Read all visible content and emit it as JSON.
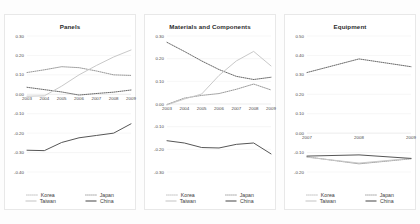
{
  "figure": {
    "background_color": "#fdfdfd",
    "panel_background": "#ffffff",
    "panel_border_color": "#e8e8e8"
  },
  "series_style": {
    "korea": {
      "color": "#8c8c8c",
      "dash": "0.9 1.1",
      "width": 0.9
    },
    "japan": {
      "color": "#595959",
      "dash": "0.9 1.1",
      "width": 0.9
    },
    "taiwan": {
      "color": "#c9c9c9",
      "dash": "none",
      "width": 1.0
    },
    "china": {
      "color": "#565656",
      "dash": "none",
      "width": 1.0
    }
  },
  "legend": {
    "items": [
      {
        "key": "korea",
        "label": "Korea"
      },
      {
        "key": "japan",
        "label": "Japan"
      },
      {
        "key": "taiwan",
        "label": "Taiwan"
      },
      {
        "key": "china",
        "label": "China"
      }
    ]
  },
  "chart_data": [
    {
      "type": "line",
      "title": "Panels",
      "xlabel": "",
      "ylabel": "",
      "x": [
        "2003",
        "2004",
        "2005",
        "2006",
        "2007",
        "2008",
        "2009"
      ],
      "yticks": [
        "0.30",
        "0.20",
        "0.10",
        "0.00",
        "-0.10",
        "-0.20",
        "-0.30",
        "-0.40"
      ],
      "ylim": [
        -0.4,
        0.3
      ],
      "grid": true,
      "legend_position": "bottom",
      "series": [
        {
          "name": "Korea",
          "values": [
            0.112,
            0.126,
            0.142,
            0.137,
            0.12,
            0.1,
            0.097
          ]
        },
        {
          "name": "Japan",
          "values": [
            0.036,
            0.024,
            0.012,
            -0.004,
            0.004,
            0.011,
            0.022
          ]
        },
        {
          "name": "Taiwan",
          "values": [
            -0.01,
            -0.008,
            0.042,
            0.1,
            0.148,
            0.192,
            0.228
          ]
        },
        {
          "name": "China",
          "values": [
            -0.288,
            -0.29,
            -0.248,
            -0.224,
            -0.212,
            -0.2,
            -0.152
          ]
        }
      ]
    },
    {
      "type": "line",
      "title": "Materials and Components",
      "xlabel": "",
      "ylabel": "",
      "x": [
        "2003",
        "2004",
        "2005",
        "2006",
        "2007",
        "2008",
        "2009"
      ],
      "yticks": [
        "0.30",
        "0.20",
        "0.10",
        "0.00",
        "-0.10",
        "-0.20",
        "-0.30"
      ],
      "ylim": [
        -0.3,
        0.3
      ],
      "grid": true,
      "legend_position": "bottom",
      "series": [
        {
          "name": "Korea",
          "values": [
            -0.002,
            0.026,
            0.038,
            0.046,
            0.065,
            0.088,
            0.062
          ]
        },
        {
          "name": "Japan",
          "values": [
            0.272,
            0.232,
            0.19,
            0.152,
            0.122,
            0.108,
            0.118
          ]
        },
        {
          "name": "Taiwan",
          "values": [
            -0.004,
            0.022,
            0.044,
            0.126,
            0.19,
            0.232,
            0.168
          ]
        },
        {
          "name": "China",
          "values": [
            -0.162,
            -0.172,
            -0.192,
            -0.194,
            -0.178,
            -0.172,
            -0.22
          ]
        }
      ]
    },
    {
      "type": "line",
      "title": "Equipment",
      "xlabel": "",
      "ylabel": "",
      "x": [
        "2007",
        "2008",
        "2009"
      ],
      "yticks": [
        "0.50",
        "0.40",
        "0.30",
        "0.20",
        "0.10",
        "0.00",
        "-0.10",
        "-0.20"
      ],
      "ylim": [
        -0.2,
        0.5
      ],
      "grid": true,
      "legend_position": "bottom",
      "series": [
        {
          "name": "Korea",
          "values": [
            -0.122,
            -0.158,
            -0.132
          ]
        },
        {
          "name": "Japan",
          "values": [
            0.312,
            0.382,
            0.342
          ]
        },
        {
          "name": "Taiwan",
          "values": [
            -0.124,
            -0.154,
            -0.13
          ]
        },
        {
          "name": "China",
          "values": [
            -0.118,
            -0.112,
            -0.13
          ]
        }
      ]
    }
  ]
}
